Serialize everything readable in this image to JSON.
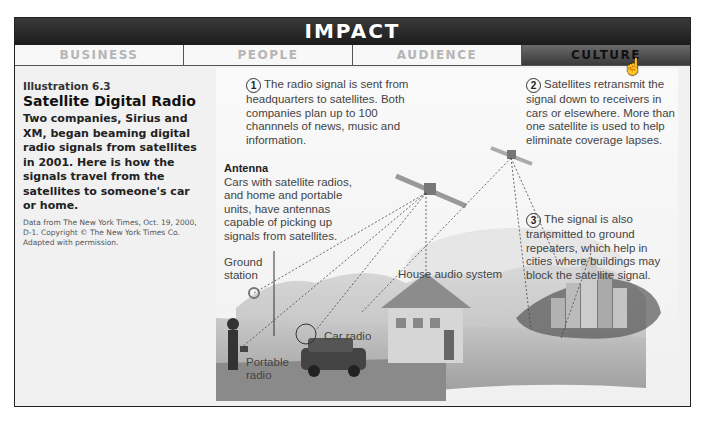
{
  "header": {
    "title": "IMPACT"
  },
  "tabs": [
    {
      "label": "BUSINESS",
      "active": false
    },
    {
      "label": "PEOPLE",
      "active": false
    },
    {
      "label": "AUDIENCE",
      "active": false
    },
    {
      "label": "CULTURE",
      "active": true
    }
  ],
  "sidebar": {
    "illustration_number": "Illustration 6.3",
    "title": "Satellite Digital Radio",
    "body": "Two companies, Sirius and XM, began beaming digital radio signals from satellites in 2001. Here is how the signals travel from the satellites to someone's car or home.",
    "credit": "Data from The New York Times, Oct. 19, 2000, D-1. Copyright © The New York Times Co. Adapted with permission."
  },
  "illustration": {
    "callouts": [
      {
        "number": "1",
        "text": "The radio signal is sent from headquarters to satellites. Both companies plan up to 100 channnels of news, music and information."
      },
      {
        "number": "2",
        "text": "Satellites retransmit the signal down to receivers in cars or elsewhere. More than one satellite is used to help eliminate coverage lapses."
      },
      {
        "number": "3",
        "text": "The signal is also transmitted to ground repeaters, which help in cities where buildings may block the satellite signal."
      }
    ],
    "antenna": {
      "heading": "Antenna",
      "text": "Cars with satellite radios, and home and portable units, have antennas capable of picking up signals from satellites."
    },
    "labels": {
      "ground_station": "Ground station",
      "house_audio": "House audio system",
      "car_radio": "Car radio",
      "portable_radio": "Portable radio"
    }
  },
  "colors": {
    "banner": "#2a2a2a",
    "active_tab": "#4a4a4a",
    "inactive_tab_text": "#b5b5b5"
  }
}
